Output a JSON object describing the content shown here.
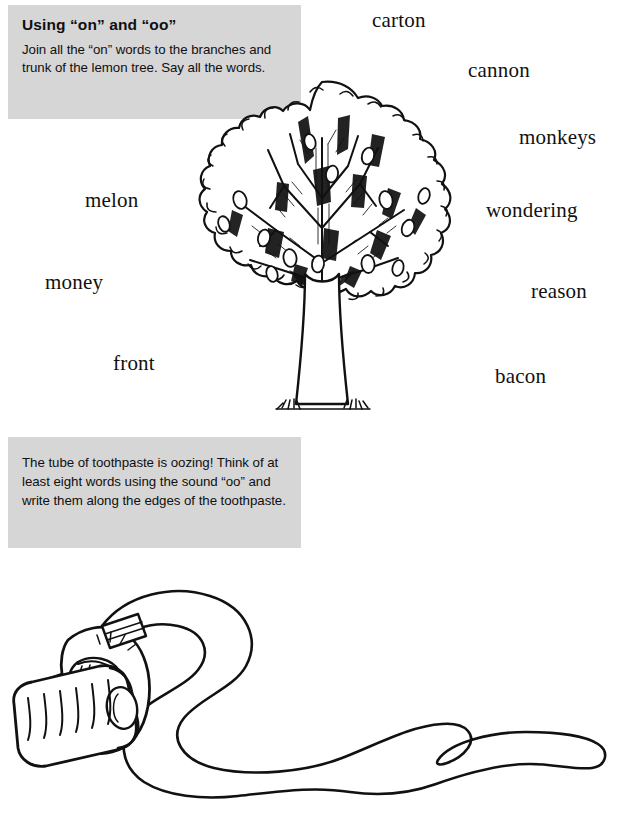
{
  "worksheet": {
    "activity_1": {
      "title": "Using “on” and “oo”",
      "body": "Join all the “on” words to the branches and trunk of the lemon tree. Say all the words."
    },
    "activity_2": {
      "body": "The tube of toothpaste is oozing! Think of at least eight words using the sound “oo” and write them along the edges of the toothpaste."
    },
    "words": [
      {
        "text": "carton",
        "x": 372,
        "y": 8
      },
      {
        "text": "cannon",
        "x": 468,
        "y": 58
      },
      {
        "text": "monkeys",
        "x": 519,
        "y": 125
      },
      {
        "text": "wondering",
        "x": 486,
        "y": 198
      },
      {
        "text": "reason",
        "x": 531,
        "y": 279
      },
      {
        "text": "bacon",
        "x": 495,
        "y": 364
      },
      {
        "text": "melon",
        "x": 85,
        "y": 188
      },
      {
        "text": "money",
        "x": 45,
        "y": 270
      },
      {
        "text": "front",
        "x": 113,
        "y": 351
      }
    ],
    "illustrations": {
      "tree": "lemon-tree-line-art",
      "toothpaste": "oozing-toothpaste-tube-line-art"
    },
    "colors": {
      "instruction_box_bg": "#d6d6d6",
      "ink": "#111111",
      "paper": "#ffffff"
    }
  }
}
